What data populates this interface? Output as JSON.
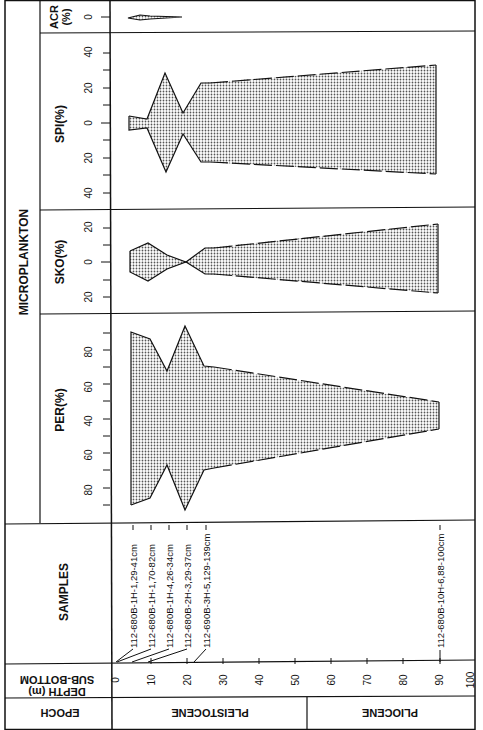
{
  "diagram": {
    "group_title": "MICROPLANKTON",
    "panels": [
      {
        "id": "acr",
        "label_line1": "ACR",
        "label_line2": "(%)",
        "ticks": [
          "0"
        ]
      },
      {
        "id": "spi",
        "label": "SPI(%)",
        "ticks": [
          "40",
          "20",
          "0",
          "20",
          "40"
        ]
      },
      {
        "id": "sko",
        "label": "SKO(%)",
        "ticks": [
          "20",
          "0",
          "20"
        ]
      },
      {
        "id": "per",
        "label": "PER(%)",
        "ticks": [
          "80",
          "60",
          "40",
          "60",
          "80"
        ]
      }
    ],
    "samples_header": "SAMPLES",
    "samples": [
      {
        "label": "112-680B-1H-1,29-41cm",
        "depth_m": 0.3
      },
      {
        "label": "112-680B-1H-1,70-82cm",
        "depth_m": 0.8
      },
      {
        "label": "112-680B-1H-4,26-34cm",
        "depth_m": 4.8
      },
      {
        "label": "112-680B-2H-3,29-37cm",
        "depth_m": 9.3
      },
      {
        "label": "112-690B-3H-5,129-139cm",
        "depth_m": 21.8
      },
      {
        "label": "112-680B-10H-6,88-100cm",
        "depth_m": 89.9
      }
    ],
    "depth_axis": {
      "label_line1": "SUB-BOTTOM",
      "label_line2": "DEPTH (m)",
      "ticks": [
        "0",
        "10",
        "20",
        "30",
        "40",
        "50",
        "60",
        "70",
        "80",
        "90",
        "100"
      ]
    },
    "epoch": {
      "header": "EPOCH",
      "items": [
        {
          "label": "PLEISTOCENE"
        },
        {
          "label": "PLIOCENE"
        }
      ]
    },
    "colors": {
      "line": "#111111",
      "fill_dot": "#555555",
      "background": "#ffffff"
    }
  }
}
